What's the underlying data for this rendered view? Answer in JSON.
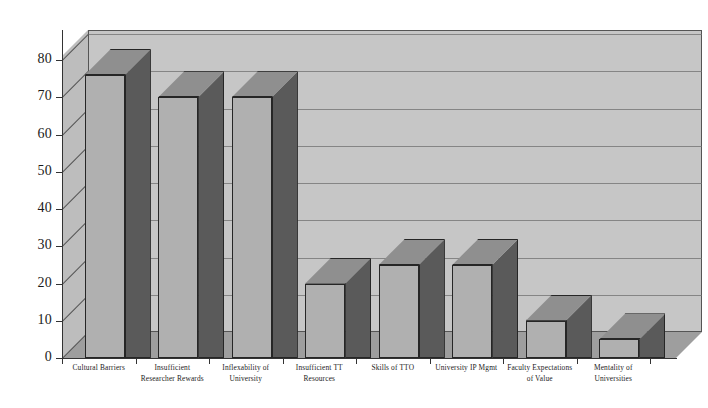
{
  "chart_data": {
    "type": "bar",
    "title": "",
    "subtitle": "",
    "xlabel": "",
    "ylabel": "",
    "ylim": [
      0,
      80
    ],
    "ytick_step": 10,
    "grid": true,
    "legend": "none",
    "style": "3d-grayscale",
    "categories": [
      "Cultural Barriers",
      "Insufficient Researcher Rewards",
      "Inflexability of University",
      "Insufficient TT Resources",
      "Skills of TTO",
      "University IP Mgmt",
      "Faculty Expectations of Value",
      "Mentality of Universities"
    ],
    "category_lines": [
      [
        "Cultural Barriers"
      ],
      [
        "Insufficient",
        "Researcher Rewards"
      ],
      [
        "Inflexability of",
        "University"
      ],
      [
        "Insufficient TT",
        "Resources"
      ],
      [
        "Skills of TTO"
      ],
      [
        "University IP Mgmt"
      ],
      [
        "Faculty Expectations",
        "of Value"
      ],
      [
        "Mentality of",
        "Universities"
      ]
    ],
    "values": [
      76,
      70,
      70,
      20,
      25,
      25,
      10,
      5
    ],
    "ytick_labels": [
      "0",
      "10",
      "20",
      "30",
      "40",
      "50",
      "60",
      "70",
      "80"
    ],
    "ytick_values": [
      0,
      10,
      20,
      30,
      40,
      50,
      60,
      70,
      80
    ]
  },
  "colors": {
    "background": "#ffffff",
    "back_wall": "#c6c6c6",
    "left_wall": "#bdbdbd",
    "floor": "#9e9e9e",
    "bar_front": "#b0b0b0",
    "bar_side": "#5a5a5a",
    "bar_top": "#8f8f8f",
    "gridline": "#6f6f6f",
    "axis": "#333333",
    "text": "#1c1c1c"
  }
}
